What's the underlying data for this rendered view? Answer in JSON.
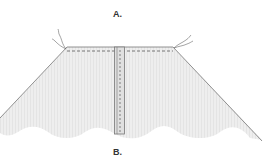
{
  "labels": {
    "top": "A.",
    "bottom": "B."
  },
  "colors": {
    "fabric": "#ececec",
    "outline": "#777777",
    "stitch": "#555555",
    "thread": "#666666"
  }
}
